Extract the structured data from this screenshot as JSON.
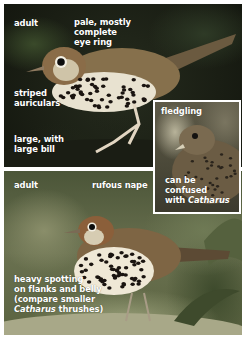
{
  "panels": {
    "top": {
      "title": "adult",
      "callouts": {
        "eye_ring": [
          "pale, mostly",
          "complete",
          "eye ring"
        ],
        "auriculars": [
          "striped",
          "auriculars"
        ],
        "size": [
          "large, with",
          "large bill"
        ]
      }
    },
    "inset": {
      "title": "fledgling",
      "callout_lines": [
        "can be",
        "confused"
      ],
      "callout_last_prefix": "with ",
      "callout_last_italic": "Catharus"
    },
    "bottom": {
      "title": "adult",
      "callouts": {
        "nape": "rufous nape",
        "spotting_lines": [
          "heavy spotting",
          "on flanks and belly",
          "(compare smaller"
        ],
        "spotting_last_italic": "Catharus",
        "spotting_last_suffix": " thrushes)"
      }
    }
  },
  "colors": {
    "label_text": "#ffffff",
    "border": "#ffffff"
  }
}
